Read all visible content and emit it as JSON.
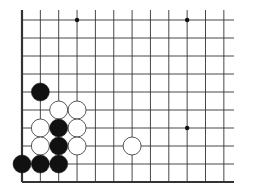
{
  "board": {
    "description": "Go board fragment (lower-left corner region)",
    "columns": 12,
    "rows": 10,
    "origin_x": 22,
    "origin_y": 20,
    "spacing_x": 18.35,
    "spacing_y": 18.0,
    "right_line_extent": 234,
    "left_edge_thick": true,
    "bottom_edge_thick": true,
    "top_edge_open": true,
    "right_edge_open": true,
    "line_color": "#333333",
    "stone_radius": 9,
    "star_points": [
      {
        "col": 3,
        "row": 0
      },
      {
        "col": 9,
        "row": 0
      },
      {
        "col": 9,
        "row": 6
      }
    ],
    "stones": [
      {
        "color": "black",
        "col": 1,
        "row": 4
      },
      {
        "color": "white",
        "col": 2,
        "row": 5
      },
      {
        "color": "white",
        "col": 3,
        "row": 5
      },
      {
        "color": "white",
        "col": 1,
        "row": 6
      },
      {
        "color": "black",
        "col": 2,
        "row": 6
      },
      {
        "color": "white",
        "col": 3,
        "row": 6
      },
      {
        "color": "white",
        "col": 1,
        "row": 7
      },
      {
        "color": "black",
        "col": 2,
        "row": 7
      },
      {
        "color": "white",
        "col": 3,
        "row": 7
      },
      {
        "color": "white",
        "col": 6,
        "row": 7
      },
      {
        "color": "black",
        "col": 0,
        "row": 8
      },
      {
        "color": "black",
        "col": 1,
        "row": 8
      },
      {
        "color": "black",
        "col": 2,
        "row": 8
      }
    ],
    "colors": {
      "black_stone": "#111111",
      "white_stone_fill": "#ffffff",
      "white_stone_stroke": "#444444",
      "background": "#ffffff"
    }
  }
}
